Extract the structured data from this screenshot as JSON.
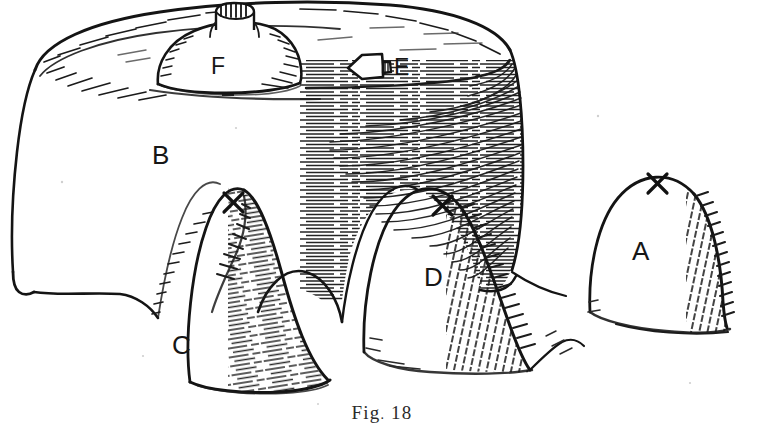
{
  "figure": {
    "caption_prefix": "Fig",
    "caption_separator": ".",
    "caption_number": "18",
    "caption_full": "Fig. 18",
    "background_color": "#ffffff",
    "ink_color": "#121212",
    "medium": "pen-and-ink line drawing"
  },
  "labels": {
    "plateau": "B",
    "dome_on_plateau": "F",
    "flask_marker": "E",
    "mound_left": "C",
    "mound_middle": "D",
    "mound_right": "A"
  },
  "markers": {
    "x_mark": "X",
    "x_count": 3,
    "x_on": [
      "C",
      "D",
      "A"
    ]
  },
  "elements": [
    {
      "id": "B",
      "name": "large-flat-topped-mound",
      "label": "B",
      "has_x_mark": false
    },
    {
      "id": "F",
      "name": "dome-with-chimney-on-plateau",
      "label": "F",
      "has_x_mark": false
    },
    {
      "id": "E",
      "name": "flask-shaped-object-on-plateau",
      "label": "E",
      "has_x_mark": false
    },
    {
      "id": "C",
      "name": "left-foreground-mound",
      "label": "C",
      "has_x_mark": true
    },
    {
      "id": "D",
      "name": "middle-foreground-mound",
      "label": "D",
      "has_x_mark": true
    },
    {
      "id": "A",
      "name": "right-foreground-mound",
      "label": "A",
      "has_x_mark": true
    }
  ]
}
